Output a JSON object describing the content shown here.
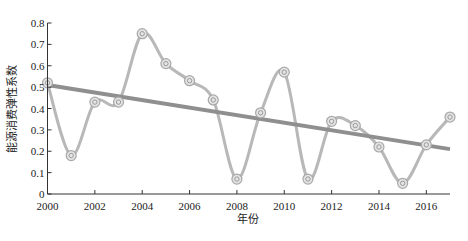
{
  "chart_data": {
    "type": "line",
    "title": "",
    "xlabel": "年份",
    "ylabel": "能源消费弹性系数",
    "xlim": [
      2000,
      2017
    ],
    "ylim": [
      0,
      0.8
    ],
    "x_ticks": [
      2000,
      2002,
      2004,
      2006,
      2008,
      2010,
      2012,
      2014,
      2016
    ],
    "x_tick_labels": [
      "2000",
      "2002",
      "2004",
      "2006",
      "2008",
      "2010",
      "2012",
      "2014",
      "2016"
    ],
    "y_ticks": [
      0,
      0.1,
      0.2,
      0.3,
      0.4,
      0.5,
      0.6,
      0.7,
      0.8
    ],
    "y_tick_labels": [
      "0",
      "0.1",
      "0.2",
      "0.3",
      "0.4",
      "0.5",
      "0.6",
      "0.7",
      "0.8"
    ],
    "grid": false,
    "legend": null,
    "series": [
      {
        "name": "能源消费弹性系数",
        "style": "smooth-line-with-circle-markers",
        "color": "#b8b8b8",
        "x": [
          2000,
          2001,
          2002,
          2003,
          2004,
          2005,
          2006,
          2007,
          2008,
          2009,
          2010,
          2011,
          2012,
          2013,
          2014,
          2015,
          2016,
          2017
        ],
        "values": [
          0.52,
          0.18,
          0.43,
          0.43,
          0.75,
          0.61,
          0.53,
          0.44,
          0.07,
          0.38,
          0.57,
          0.07,
          0.34,
          0.32,
          0.22,
          0.05,
          0.23,
          0.36
        ]
      },
      {
        "name": "trend",
        "style": "linear-trend",
        "color": "#8f8f8f",
        "x": [
          2000,
          2017
        ],
        "values": [
          0.51,
          0.21
        ]
      }
    ]
  }
}
